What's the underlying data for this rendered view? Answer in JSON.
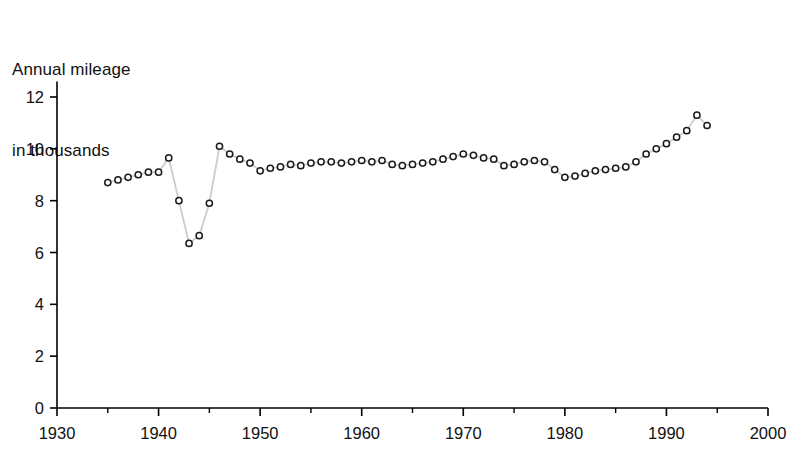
{
  "chart_data": {
    "type": "line",
    "title": "Annual mileage\nin thousands",
    "title_line1": "Annual mileage",
    "title_line2": "in thousands",
    "xlabel": "",
    "ylabel": "Annual mileage in thousands",
    "xlim": [
      1930,
      2000
    ],
    "ylim": [
      0,
      12.6
    ],
    "grid": false,
    "legend": null,
    "marker": "open-circle",
    "line_color": "#cccccc",
    "marker_edge_color": "#1a1a1a",
    "marker_face_color": "#ffffff",
    "axis_color": "#000000",
    "xticks": [
      1930,
      1940,
      1950,
      1960,
      1970,
      1980,
      1990,
      2000
    ],
    "xtick_labels": [
      "1930",
      "1940",
      "1950",
      "1960",
      "1970",
      "1980",
      "1990",
      "2000"
    ],
    "xminor_ticks": [
      1935,
      1945,
      1955,
      1965,
      1975,
      1985,
      1995
    ],
    "yticks": [
      0,
      2,
      4,
      6,
      8,
      10,
      12
    ],
    "ytick_labels": [
      "0",
      "2",
      "4",
      "6",
      "8",
      "10",
      "12"
    ],
    "x": [
      1935,
      1936,
      1937,
      1938,
      1939,
      1940,
      1941,
      1942,
      1943,
      1944,
      1945,
      1946,
      1947,
      1948,
      1949,
      1950,
      1951,
      1952,
      1953,
      1954,
      1955,
      1956,
      1957,
      1958,
      1959,
      1960,
      1961,
      1962,
      1963,
      1964,
      1965,
      1966,
      1967,
      1968,
      1969,
      1970,
      1971,
      1972,
      1973,
      1974,
      1975,
      1976,
      1977,
      1978,
      1979,
      1980,
      1981,
      1982,
      1983,
      1984,
      1985,
      1986,
      1987,
      1988,
      1989,
      1990,
      1991,
      1992,
      1993,
      1994
    ],
    "values": [
      8.7,
      8.8,
      8.9,
      9.0,
      9.1,
      9.1,
      9.65,
      8.0,
      6.35,
      6.65,
      7.9,
      10.1,
      9.8,
      9.6,
      9.45,
      9.15,
      9.25,
      9.3,
      9.4,
      9.35,
      9.45,
      9.5,
      9.5,
      9.45,
      9.5,
      9.55,
      9.5,
      9.55,
      9.4,
      9.35,
      9.4,
      9.45,
      9.5,
      9.6,
      9.7,
      9.8,
      9.75,
      9.65,
      9.6,
      9.35,
      9.4,
      9.5,
      9.55,
      9.5,
      9.2,
      8.9,
      8.95,
      9.05,
      9.15,
      9.2,
      9.25,
      9.3,
      9.5,
      9.8,
      10.0,
      10.2,
      10.45,
      10.7,
      11.3,
      10.9
    ]
  }
}
